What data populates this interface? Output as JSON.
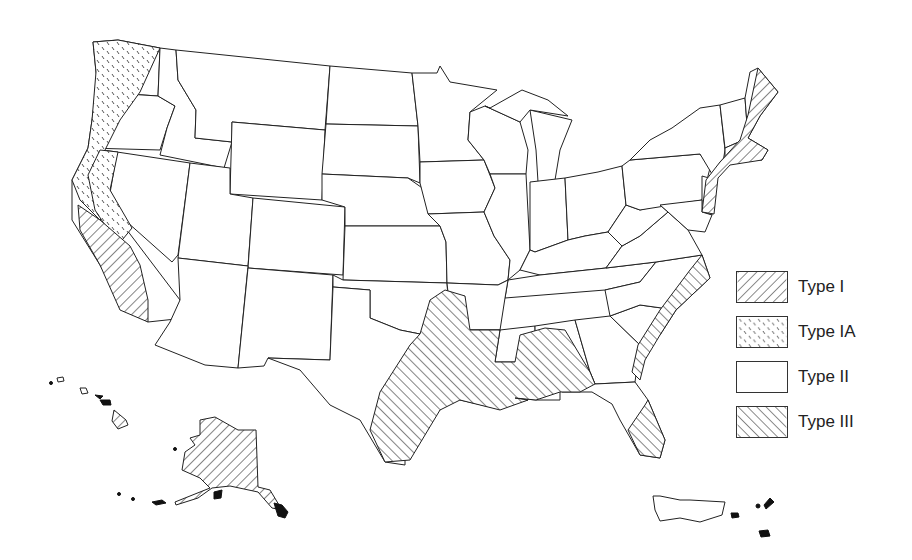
{
  "map": {
    "subject": "United States zone map",
    "regions_shown": [
      "Contiguous United States",
      "Alaska",
      "Hawaii",
      "Puerto Rico",
      "U.S. Virgin Islands"
    ]
  },
  "legend": {
    "items": [
      {
        "label": "Type I",
        "pattern": "hatch-forward",
        "color": "#333333"
      },
      {
        "label": "Type IA",
        "pattern": "dashes",
        "color": "#555555"
      },
      {
        "label": "Type II",
        "pattern": "none",
        "color": "#ffffff"
      },
      {
        "label": "Type III",
        "pattern": "hatch-back",
        "color": "#333333"
      }
    ]
  },
  "zones": {
    "type_i": [
      "California coast",
      "Northeast coast",
      "Alaska",
      "Hawaii (Big Island)"
    ],
    "type_ia": [
      "Pacific Northwest coast",
      "Northern California"
    ],
    "type_ii": [
      "Interior states",
      "Puerto Rico"
    ],
    "type_iii": [
      "Gulf Coast",
      "Atlantic coast (Carolinas/Georgia)",
      "South Florida"
    ]
  }
}
